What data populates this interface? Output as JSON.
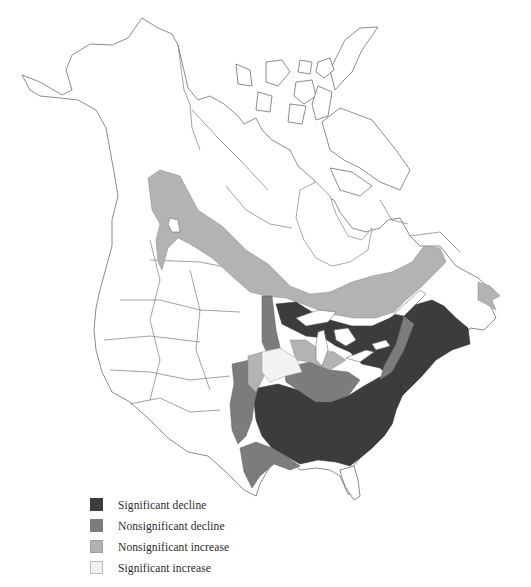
{
  "map": {
    "type": "choropleth",
    "extent": "North America (Canada, United States, northern Mexico)",
    "regions_by_category": {
      "significant_decline": [
        "Eastern United States (Mississippi valley to Atlantic coast)",
        "Great Lakes northern shore / southern Ontario-Quebec",
        "Appalachians to New England",
        "Maritime provinces"
      ],
      "nonsignificant_decline": [
        "Upper Midwest",
        "Southern Great Plains edge",
        "Parts of Ohio Valley",
        "Gulf coast fringe"
      ],
      "nonsignificant_increase": [
        "Boreal belt from northern Alberta/Saskatchewan to Labrador and Newfoundland",
        "Scattered Midwest patches"
      ],
      "significant_increase": [
        "Central Great Plains (Nebraska/Iowa area)"
      ]
    }
  },
  "legend": {
    "items": [
      {
        "label": "Significant decline",
        "color": "#3c3c3c",
        "border": "#3c3c3c"
      },
      {
        "label": "Nonsignificant decline",
        "color": "#7c7c7c",
        "border": "#7c7c7c"
      },
      {
        "label": "Nonsignificant increase",
        "color": "#b3b3b3",
        "border": "#a0a0a0"
      },
      {
        "label": "Significant increase",
        "color": "#f2f2f2",
        "border": "#bdbdbd"
      }
    ]
  }
}
